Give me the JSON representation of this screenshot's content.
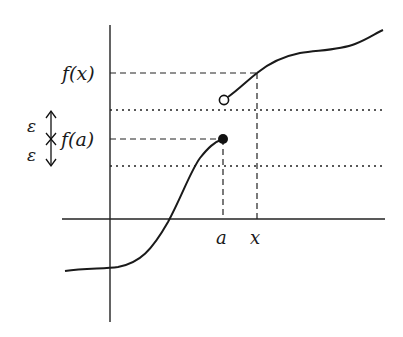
{
  "diagram": {
    "labels": {
      "fx": "f(x)",
      "fa": "f(a)",
      "epsilon_upper": "ε",
      "epsilon_lower": "ε",
      "a": "a",
      "x": "x"
    },
    "colors": {
      "stroke": "#1a1a1a",
      "background": "#ffffff"
    },
    "points": {
      "filled_dot": {
        "label": "f(a)",
        "type": "closed"
      },
      "open_circle": {
        "label": "right limit",
        "type": "open"
      }
    }
  }
}
